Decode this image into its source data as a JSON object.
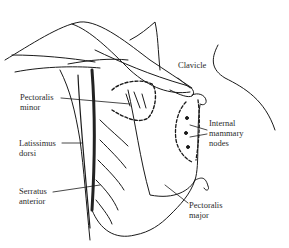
{
  "diagram": {
    "labels": {
      "clavicle": "Clavicle",
      "pectoralis_minor_1": "Pectoralis",
      "pectoralis_minor_2": "minor",
      "internal_mammary_1": "Internal",
      "internal_mammary_2": "mammary",
      "internal_mammary_3": "nodes",
      "latissimus_1": "Latissimus",
      "latissimus_2": "dorsi",
      "serratus_1": "Serratus",
      "serratus_2": "anterior",
      "pectoralis_major_1": "Pectoralis",
      "pectoralis_major_2": "major"
    },
    "colors": {
      "line": "#1a1a1a",
      "background": "#ffffff",
      "text": "#2a2a2a"
    }
  }
}
